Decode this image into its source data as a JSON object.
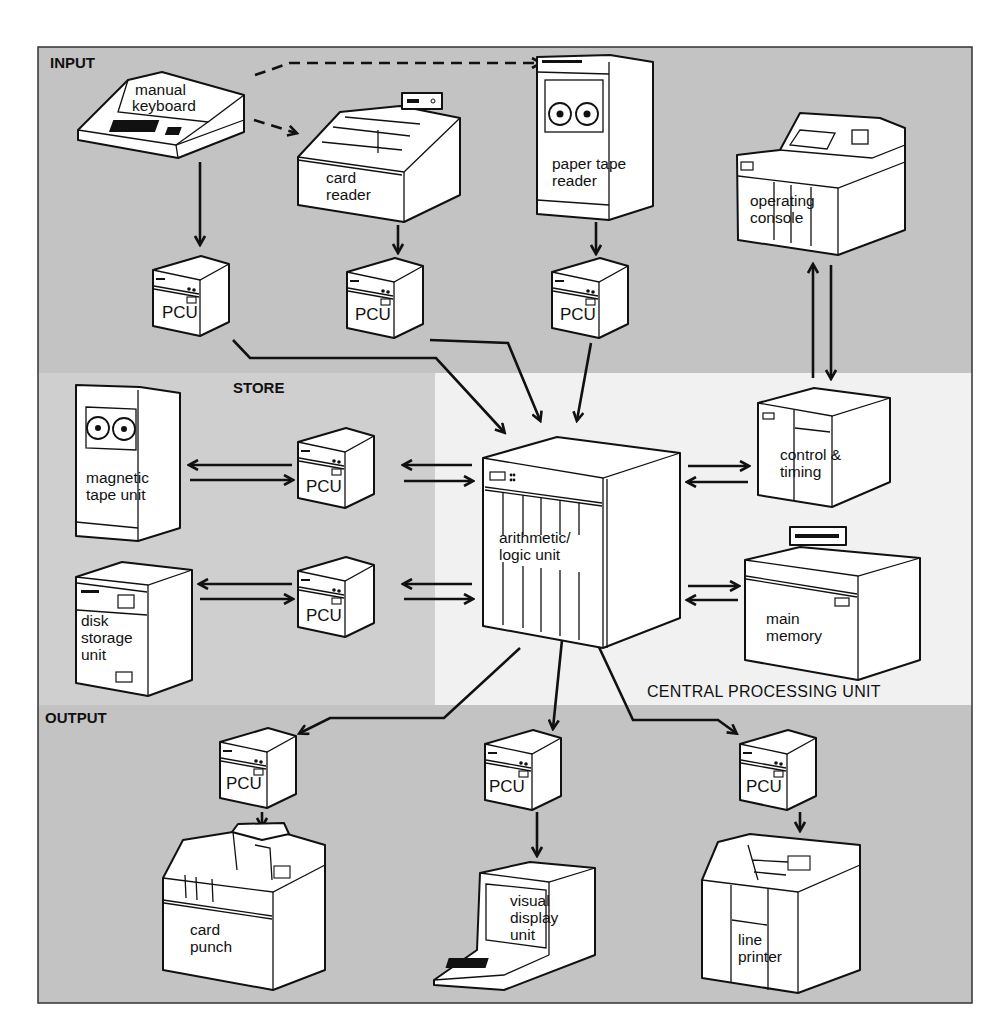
{
  "colors": {
    "input_bg": "#c2c2c2",
    "store_bg": "#cfcfcf",
    "cpu_bg": "#f2f2f2",
    "output_bg": "#c2c2c2",
    "line": "#111111",
    "device_fill": "#ffffff"
  },
  "regions": {
    "input": "INPUT",
    "store": "STORE",
    "cpu": "CENTRAL PROCESSING UNIT",
    "output": "OUTPUT"
  },
  "devices": {
    "manual_keyboard": [
      "manual",
      "keyboard"
    ],
    "card_reader": [
      "card",
      "reader"
    ],
    "paper_tape_reader": [
      "paper tape",
      "reader"
    ],
    "operating_console": [
      "operating",
      "console"
    ],
    "magnetic_tape_unit": [
      "magnetic",
      "tape unit"
    ],
    "disk_storage_unit": [
      "disk",
      "storage",
      "unit"
    ],
    "arithmetic_logic_unit": [
      "arithmetic/",
      "logic unit"
    ],
    "control_timing": [
      "control &",
      "timing"
    ],
    "main_memory": [
      "main",
      "memory"
    ],
    "card_punch": [
      "card",
      "punch"
    ],
    "visual_display_unit": [
      "visual",
      "display",
      "unit"
    ],
    "line_printer": [
      "line",
      "printer"
    ]
  },
  "pcu_label": "PCU",
  "pcus": [
    {
      "id": "pcu-keyboard",
      "label": "PCU"
    },
    {
      "id": "pcu-card-reader",
      "label": "PCU"
    },
    {
      "id": "pcu-paper-tape",
      "label": "PCU"
    },
    {
      "id": "pcu-magnetic-tape",
      "label": "PCU"
    },
    {
      "id": "pcu-disk",
      "label": "PCU"
    },
    {
      "id": "pcu-card-punch",
      "label": "PCU"
    },
    {
      "id": "pcu-vdu",
      "label": "PCU"
    },
    {
      "id": "pcu-line-printer",
      "label": "PCU"
    }
  ],
  "connections": [
    {
      "from": "manual keyboard",
      "to": "card reader",
      "style": "dashed"
    },
    {
      "from": "manual keyboard",
      "to": "paper tape reader",
      "style": "dashed"
    },
    {
      "from": "manual keyboard",
      "to": "PCU",
      "style": "solid"
    },
    {
      "from": "card reader",
      "to": "PCU",
      "style": "solid"
    },
    {
      "from": "paper tape reader",
      "to": "PCU",
      "style": "solid"
    },
    {
      "from": "input PCUs",
      "to": "arithmetic/logic unit",
      "style": "solid"
    },
    {
      "from": "magnetic tape unit",
      "to": "PCU",
      "style": "bidirectional"
    },
    {
      "from": "disk storage unit",
      "to": "PCU",
      "style": "bidirectional"
    },
    {
      "from": "store PCUs",
      "to": "arithmetic/logic unit",
      "style": "bidirectional"
    },
    {
      "from": "arithmetic/logic unit",
      "to": "control & timing",
      "style": "bidirectional"
    },
    {
      "from": "arithmetic/logic unit",
      "to": "main memory",
      "style": "bidirectional"
    },
    {
      "from": "control & timing",
      "to": "operating console",
      "style": "bidirectional"
    },
    {
      "from": "arithmetic/logic unit",
      "to": "output PCUs",
      "style": "solid"
    },
    {
      "from": "PCU",
      "to": "card punch",
      "style": "solid"
    },
    {
      "from": "PCU",
      "to": "visual display unit",
      "style": "solid"
    },
    {
      "from": "PCU",
      "to": "line printer",
      "style": "solid"
    }
  ]
}
